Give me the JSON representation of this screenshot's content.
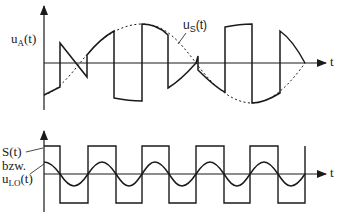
{
  "top_panel": {
    "y_label": {
      "main": "u",
      "sub": "A",
      "tail": "(t)"
    },
    "x_label": "t",
    "reference_label": {
      "main": "u",
      "sub": "S",
      "tail": "(t)"
    },
    "description": "Output signal u_A(t): input sine u_S(t) (dashed) multiplied by a ±1 switching signal"
  },
  "bottom_panel": {
    "y_label_line1": "S(t)",
    "y_label_line2": "bzw.",
    "y_label_line3": {
      "main": "u",
      "sub": "LO",
      "tail": "(t)"
    },
    "x_label": "t",
    "description": "Switching square wave S(t) or local oscillator sine u_LO(t)"
  },
  "colors": {
    "stroke": "#1a1a1a",
    "background": "#ffffff"
  }
}
